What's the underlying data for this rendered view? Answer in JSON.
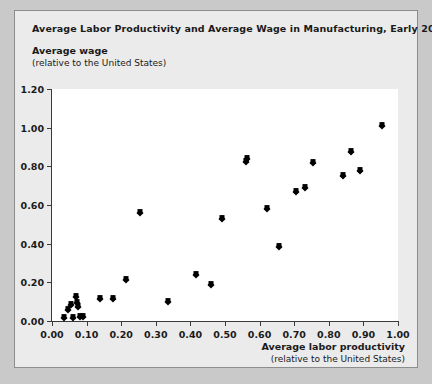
{
  "chart_data": {
    "type": "scatter",
    "title": "Average Labor Productivity and Average Wage in Manufacturing, Early 2000s",
    "ylabel_line1": "Average wage",
    "ylabel_line2": "(relative to the United States)",
    "xlabel_line1": "Average labor productivity",
    "xlabel_line2": "(relative to the United States)",
    "xlim": [
      0.0,
      1.0
    ],
    "ylim": [
      0.0,
      1.2
    ],
    "xticks": [
      "0.00",
      "0.10",
      "0.20",
      "0.30",
      "0.40",
      "0.50",
      "0.60",
      "0.70",
      "0.80",
      "0.90",
      "1.00"
    ],
    "xtick_values": [
      0.0,
      0.1,
      0.2,
      0.3,
      0.4,
      0.5,
      0.6,
      0.7,
      0.8,
      0.9,
      1.0
    ],
    "yticks": [
      "0.00",
      "0.20",
      "0.40",
      "0.60",
      "0.80",
      "1.00",
      "1.20"
    ],
    "ytick_values": [
      0.0,
      0.2,
      0.4,
      0.6,
      0.8,
      1.0,
      1.2
    ],
    "grid": false,
    "legend": false,
    "marker": "diamond",
    "marker_color": "#000000",
    "points": [
      {
        "x": 0.035,
        "y": 0.015
      },
      {
        "x": 0.045,
        "y": 0.055
      },
      {
        "x": 0.055,
        "y": 0.085
      },
      {
        "x": 0.06,
        "y": 0.015
      },
      {
        "x": 0.07,
        "y": 0.125
      },
      {
        "x": 0.072,
        "y": 0.095
      },
      {
        "x": 0.075,
        "y": 0.075
      },
      {
        "x": 0.08,
        "y": 0.02
      },
      {
        "x": 0.09,
        "y": 0.02
      },
      {
        "x": 0.14,
        "y": 0.115
      },
      {
        "x": 0.175,
        "y": 0.115
      },
      {
        "x": 0.215,
        "y": 0.21
      },
      {
        "x": 0.255,
        "y": 0.56
      },
      {
        "x": 0.335,
        "y": 0.1
      },
      {
        "x": 0.415,
        "y": 0.24
      },
      {
        "x": 0.46,
        "y": 0.185
      },
      {
        "x": 0.49,
        "y": 0.53
      },
      {
        "x": 0.56,
        "y": 0.82
      },
      {
        "x": 0.565,
        "y": 0.84
      },
      {
        "x": 0.62,
        "y": 0.58
      },
      {
        "x": 0.655,
        "y": 0.385
      },
      {
        "x": 0.705,
        "y": 0.665
      },
      {
        "x": 0.73,
        "y": 0.69
      },
      {
        "x": 0.755,
        "y": 0.815
      },
      {
        "x": 0.84,
        "y": 0.75
      },
      {
        "x": 0.865,
        "y": 0.875
      },
      {
        "x": 0.89,
        "y": 0.775
      },
      {
        "x": 0.955,
        "y": 1.01
      }
    ]
  }
}
